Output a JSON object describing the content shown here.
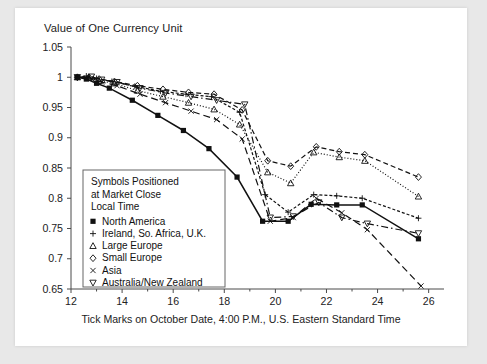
{
  "figure": {
    "title": "Value of One Currency Unit",
    "xlabel": "Tick Marks on October Date, 4:00 P.M., U.S. Eastern Standard Time"
  },
  "legend": {
    "title_lines": [
      "Symbols Positioned",
      "at Market Close",
      "Local Time"
    ],
    "entries": [
      {
        "symbol": "square-filled",
        "glyph": "▪",
        "label": "North America"
      },
      {
        "symbol": "plus",
        "glyph": "+",
        "label": "Ireland, So. Africa, U.K."
      },
      {
        "symbol": "triangle-up",
        "glyph": "△",
        "label": "Large Europe"
      },
      {
        "symbol": "diamond",
        "glyph": "◇",
        "label": "Small Europe"
      },
      {
        "symbol": "cross",
        "glyph": "×",
        "label": "Asia"
      },
      {
        "symbol": "triangle-down",
        "glyph": "▽",
        "label": "Australia/New Zealand"
      }
    ]
  },
  "chart_data": {
    "type": "line",
    "title": "Value of One Currency Unit",
    "xlabel": "Tick Marks on October Date, 4:00 P.M., U.S. Eastern Standard Time",
    "ylabel": "Value of One Currency Unit",
    "xlim": [
      12,
      26.6
    ],
    "ylim": [
      0.65,
      1.05
    ],
    "xticks": [
      12,
      14,
      16,
      18,
      20,
      22,
      24,
      26
    ],
    "xtick_labels": [
      "12",
      "14",
      "16",
      "18",
      "20",
      "22",
      "24",
      "26"
    ],
    "yticks": [
      0.65,
      0.7,
      0.75,
      0.8,
      0.85,
      0.9,
      0.95,
      1,
      1.05
    ],
    "ytick_labels": [
      "0.65",
      "0.7",
      "0.75",
      "0.8",
      "0.85",
      "0.9",
      "0.95",
      "1",
      "1.05"
    ],
    "grid": false,
    "legend_position": "lower-left-inside",
    "series": [
      {
        "name": "North America",
        "marker": "square-filled",
        "linestyle": "solid",
        "x": [
          12.25,
          12.6,
          13.0,
          13.5,
          14.4,
          15.4,
          16.4,
          17.4,
          18.5,
          19.5,
          20.5,
          21.4,
          22.4,
          23.4,
          25.6
        ],
        "y": [
          1.0,
          0.997,
          0.99,
          0.982,
          0.962,
          0.937,
          0.912,
          0.882,
          0.835,
          0.762,
          0.762,
          0.79,
          0.789,
          0.789,
          0.733
        ]
      },
      {
        "name": "Ireland, So. Africa, U.K.",
        "marker": "plus",
        "linestyle": "dashed-fine",
        "x": [
          12.25,
          12.6,
          13.0,
          13.6,
          14.5,
          15.5,
          16.5,
          17.5,
          18.6,
          19.6,
          20.5,
          21.5,
          22.4,
          23.4,
          25.6
        ],
        "y": [
          1.0,
          1.002,
          0.998,
          0.993,
          0.985,
          0.977,
          0.972,
          0.968,
          0.942,
          0.806,
          0.777,
          0.806,
          0.804,
          0.8,
          0.767
        ]
      },
      {
        "name": "Large Europe",
        "marker": "triangle-up",
        "linestyle": "dotted",
        "x": [
          12.25,
          12.7,
          13.1,
          13.7,
          14.6,
          15.6,
          16.6,
          17.6,
          18.6,
          19.7,
          20.6,
          21.5,
          22.5,
          23.5,
          25.6
        ],
        "y": [
          1.0,
          0.999,
          0.994,
          0.99,
          0.978,
          0.968,
          0.958,
          0.947,
          0.922,
          0.843,
          0.825,
          0.876,
          0.868,
          0.862,
          0.803
        ]
      },
      {
        "name": "Small Europe",
        "marker": "diamond",
        "linestyle": "dashed",
        "x": [
          12.25,
          12.7,
          13.1,
          13.7,
          14.6,
          15.6,
          16.6,
          17.6,
          18.7,
          19.7,
          20.6,
          21.6,
          22.5,
          23.5,
          25.6
        ],
        "y": [
          1.0,
          1.0,
          0.997,
          0.993,
          0.986,
          0.98,
          0.975,
          0.972,
          0.946,
          0.862,
          0.853,
          0.885,
          0.877,
          0.872,
          0.835
        ]
      },
      {
        "name": "Asia",
        "marker": "cross",
        "linestyle": "long-dash",
        "x": [
          12.25,
          12.8,
          13.2,
          13.8,
          14.7,
          15.7,
          16.7,
          17.7,
          18.7,
          19.8,
          20.7,
          21.6,
          22.6,
          23.6,
          25.7
        ],
        "y": [
          1.0,
          0.998,
          0.992,
          0.986,
          0.972,
          0.958,
          0.944,
          0.93,
          0.898,
          0.762,
          0.768,
          0.8,
          0.776,
          0.748,
          0.655
        ]
      },
      {
        "name": "Australia/New Zealand",
        "marker": "triangle-down",
        "linestyle": "dash-dot",
        "x": [
          12.25,
          12.8,
          13.2,
          13.8,
          14.7,
          15.7,
          16.7,
          17.7,
          18.8,
          19.8,
          20.7,
          21.7,
          22.6,
          23.6,
          25.6
        ],
        "y": [
          1.0,
          1.001,
          0.996,
          0.992,
          0.982,
          0.974,
          0.968,
          0.962,
          0.955,
          0.768,
          0.77,
          0.793,
          0.768,
          0.758,
          0.742
        ]
      }
    ]
  }
}
